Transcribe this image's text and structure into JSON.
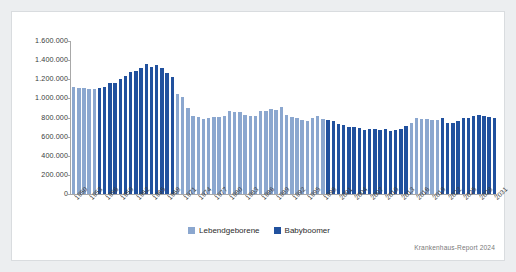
{
  "card": {
    "background": "#ffffff",
    "outer_background": "#eceef0"
  },
  "colors": {
    "lebendgeborene": "#8ba7cf",
    "babyboomer": "#21519e",
    "axis": "#a8a8a8",
    "text": "#3c3c3c",
    "source_text": "#7a7a7a"
  },
  "legend": {
    "position": "bottom-center",
    "entries": [
      {
        "label": "Lebendgeborene",
        "color": "#8ba7cf",
        "key": "lebendgeborene"
      },
      {
        "label": "Babyboomer",
        "color": "#21519e",
        "key": "babyboomer"
      }
    ]
  },
  "source": {
    "text": "Krankenhaus-Report 2024"
  },
  "axes": {
    "y_tick_labels": [
      "1.600.000",
      "1.400.000",
      "1.200.000",
      "1.000.000",
      "800.000",
      "600.000",
      "400.000",
      "200.000",
      "0"
    ],
    "x_tick_labels": [
      "1950",
      "1953",
      "1956",
      "1959",
      "1962",
      "1965",
      "1968",
      "1971",
      "1974",
      "1977",
      "1980",
      "1983",
      "1986",
      "1989",
      "1992",
      "1995",
      "1998",
      "2001",
      "2004",
      "2007",
      "2010",
      "2013",
      "2016",
      "2019",
      "2022",
      "2025",
      "2028",
      "2031"
    ]
  },
  "chart_data": {
    "type": "bar",
    "title": "",
    "subtitle": "",
    "xlabel": "",
    "ylabel": "",
    "ylim": [
      0,
      1600000
    ],
    "ytick_step": 200000,
    "grid": false,
    "legend_position": "bottom-center",
    "annotations": [
      "Krankenhaus-Report 2024"
    ],
    "categories": [
      1950,
      1951,
      1952,
      1953,
      1954,
      1955,
      1956,
      1957,
      1958,
      1959,
      1960,
      1961,
      1962,
      1963,
      1964,
      1965,
      1966,
      1967,
      1968,
      1969,
      1970,
      1971,
      1972,
      1973,
      1974,
      1975,
      1976,
      1977,
      1978,
      1979,
      1980,
      1981,
      1982,
      1983,
      1984,
      1985,
      1986,
      1987,
      1988,
      1989,
      1990,
      1991,
      1992,
      1993,
      1994,
      1995,
      1996,
      1997,
      1998,
      1999,
      2000,
      2001,
      2002,
      2003,
      2004,
      2005,
      2006,
      2007,
      2008,
      2009,
      2010,
      2011,
      2012,
      2013,
      2014,
      2015,
      2016,
      2017,
      2018,
      2019,
      2020,
      2021,
      2022,
      2023,
      2024,
      2025,
      2026,
      2027,
      2028,
      2029,
      2030,
      2031
    ],
    "series": [
      {
        "name": "Lebendgeborene",
        "color": "#8ba7cf",
        "values": [
          1116000,
          1106000,
          1105000,
          1095000,
          1102000,
          1104000,
          1124000,
          1162000,
          1158000,
          1201000,
          1232000,
          1276000,
          1288000,
          1318000,
          1357000,
          1325000,
          1345000,
          1322000,
          1267000,
          1222000,
          1047000,
          1013000,
          901000,
          815000,
          805000,
          783000,
          798000,
          805000,
          808000,
          817000,
          866000,
          862000,
          861000,
          827000,
          812000,
          814000,
          868000,
          868000,
          893000,
          880000,
          906000,
          830000,
          809000,
          798000,
          769000,
          765000,
          796000,
          812000,
          785000,
          771000,
          767000,
          734000,
          719000,
          706000,
          706000,
          686000,
          673000,
          685000,
          683000,
          665000,
          678000,
          663000,
          674000,
          682000,
          715000,
          738000,
          792000,
          785000,
          788000,
          778000,
          773000,
          795000,
          739000,
          745000,
          760000,
          792000,
          800000,
          820000,
          830000,
          820000,
          810000,
          800000
        ]
      },
      {
        "name": "Babyboomer",
        "color": "#21519e",
        "note": "Highlighted birth cohorts and their projected age-related echo periods",
        "highlighted_year_ranges": [
          [
            1955,
            1969
          ],
          [
            1999,
            2014
          ],
          [
            2021,
            2031
          ]
        ],
        "values": [
          null,
          null,
          null,
          null,
          null,
          1104000,
          1124000,
          1162000,
          1158000,
          1201000,
          1232000,
          1276000,
          1288000,
          1318000,
          1357000,
          1325000,
          1345000,
          1322000,
          1267000,
          1222000,
          null,
          null,
          null,
          null,
          null,
          null,
          null,
          null,
          null,
          null,
          null,
          null,
          null,
          null,
          null,
          null,
          null,
          null,
          null,
          null,
          null,
          null,
          null,
          null,
          null,
          null,
          null,
          null,
          null,
          771000,
          767000,
          734000,
          719000,
          706000,
          706000,
          686000,
          673000,
          685000,
          683000,
          665000,
          678000,
          663000,
          674000,
          682000,
          715000,
          null,
          null,
          null,
          null,
          null,
          null,
          795000,
          739000,
          745000,
          760000,
          792000,
          800000,
          820000,
          830000,
          820000,
          810000,
          800000
        ]
      }
    ]
  }
}
